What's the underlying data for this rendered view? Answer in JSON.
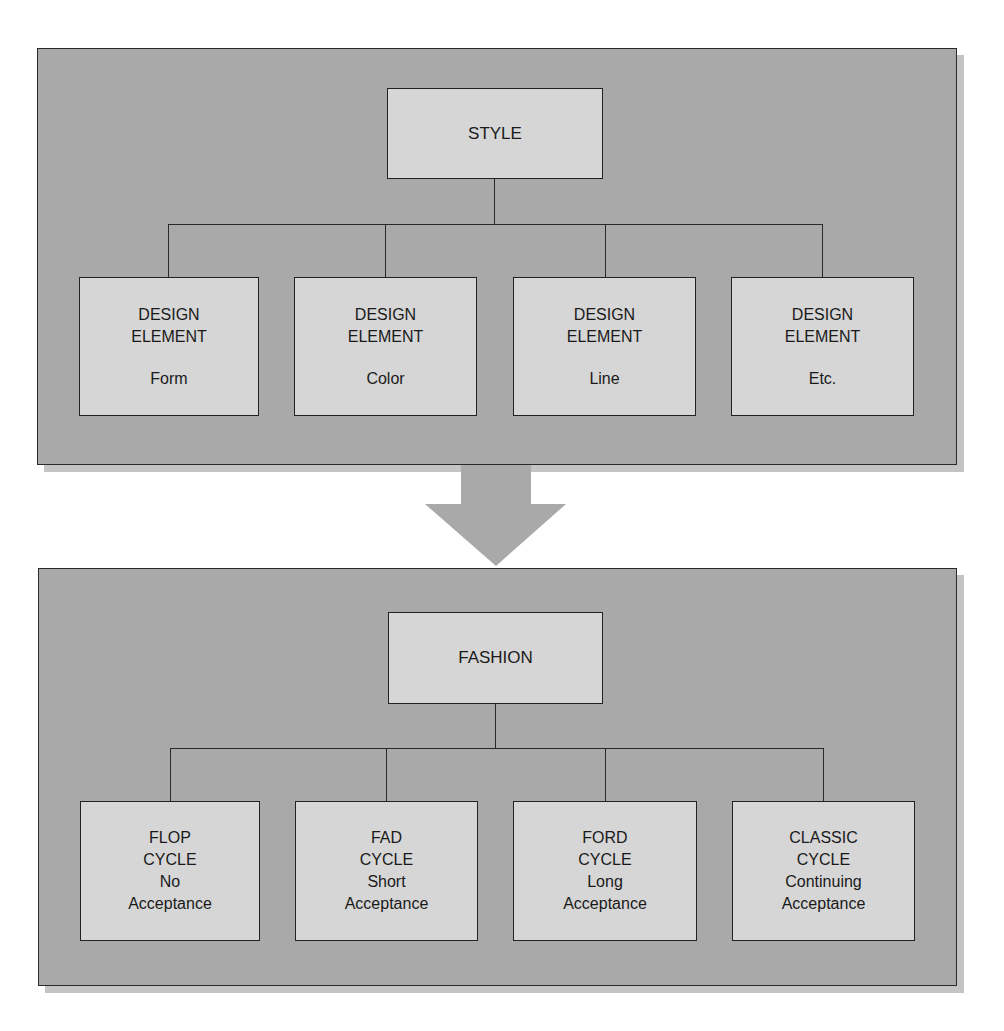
{
  "colors": {
    "panel": "#a9a9a9",
    "panel_shadow": "#c4c4c4",
    "box": "#d6d6d6",
    "border": "#222222",
    "arrow": "#a9a9a9",
    "background": "#ffffff"
  },
  "top_panel": {
    "root": {
      "label": "STYLE"
    },
    "children": [
      {
        "line1": "DESIGN",
        "line2": "ELEMENT",
        "line3": "Form"
      },
      {
        "line1": "DESIGN",
        "line2": "ELEMENT",
        "line3": "Color"
      },
      {
        "line1": "DESIGN",
        "line2": "ELEMENT",
        "line3": "Line"
      },
      {
        "line1": "DESIGN",
        "line2": "ELEMENT",
        "line3": "Etc."
      }
    ]
  },
  "arrow": {
    "icon": "down-arrow-icon",
    "direction": "down"
  },
  "bottom_panel": {
    "root": {
      "label": "FASHION"
    },
    "children": [
      {
        "line1": "FLOP",
        "line2": "CYCLE",
        "line3": "No",
        "line4": "Acceptance"
      },
      {
        "line1": "FAD",
        "line2": "CYCLE",
        "line3": "Short",
        "line4": "Acceptance"
      },
      {
        "line1": "FORD",
        "line2": "CYCLE",
        "line3": "Long",
        "line4": "Acceptance"
      },
      {
        "line1": "CLASSIC",
        "line2": "CYCLE",
        "line3": "Continuing",
        "line4": "Acceptance"
      }
    ]
  }
}
